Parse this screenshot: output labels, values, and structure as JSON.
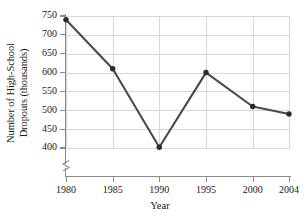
{
  "chart_data": {
    "type": "line",
    "title": "",
    "xlabel": "Year",
    "ylabel": "Number of High-School Dropouts (thousands)",
    "ylabel_line1": "Number of High-School",
    "ylabel_line2": "Dropouts (thousands)",
    "x": [
      1980,
      1985,
      1990,
      1995,
      2000,
      2004
    ],
    "categories": [
      "1980",
      "1985",
      "1990",
      "1995",
      "2000",
      "2004"
    ],
    "values": [
      740,
      610,
      402,
      600,
      510,
      490
    ],
    "series": [
      {
        "name": "Number of High-School Dropouts (thousands)",
        "values": [
          740,
          610,
          402,
          600,
          510,
          490
        ]
      }
    ],
    "xtick_labels": [
      "1980",
      "1985",
      "1990",
      "1995",
      "2000",
      "2004"
    ],
    "ytick_labels": [
      "400",
      "450",
      "500",
      "550",
      "600",
      "650",
      "700",
      "750"
    ],
    "ytick_values": [
      400,
      450,
      500,
      550,
      600,
      650,
      700,
      750
    ],
    "ylim": [
      400,
      750
    ],
    "xlim": [
      1980,
      2004
    ],
    "y_axis_break": true,
    "grid": true,
    "grid_color": "#d8d8d8",
    "legend": "none",
    "line_color": "#4a4a4a",
    "marker_color": "#2b2b2b",
    "marker": "circle",
    "axis_color": "#8a8a8a"
  },
  "axis": {
    "y_title_line1": "Number of High-School",
    "y_title_line2": "Dropouts (thousands)",
    "x_title": "Year"
  }
}
